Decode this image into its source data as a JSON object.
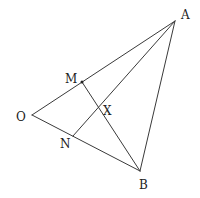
{
  "diagram": {
    "type": "geometry",
    "stroke_color": "#3a3a3a",
    "text_color": "#222222",
    "points": {
      "A": {
        "x": 175,
        "y": 21,
        "label": "A",
        "lx": 181,
        "ly": 19
      },
      "O": {
        "x": 32,
        "y": 115,
        "label": "O",
        "lx": 16,
        "ly": 121
      },
      "B": {
        "x": 140,
        "y": 171,
        "label": "B",
        "lx": 139,
        "ly": 189
      },
      "M": {
        "x": 82,
        "y": 82,
        "label": "M",
        "lx": 65,
        "ly": 83
      },
      "N": {
        "x": 73,
        "y": 136,
        "label": "N",
        "lx": 60,
        "ly": 148
      },
      "X": {
        "x": 97,
        "y": 108,
        "label": "X",
        "lx": 103,
        "ly": 115
      }
    },
    "segments": [
      {
        "from": "O",
        "to": "A"
      },
      {
        "from": "O",
        "to": "B"
      },
      {
        "from": "A",
        "to": "B"
      },
      {
        "from": "A",
        "to": "N"
      },
      {
        "from": "M",
        "to": "B"
      }
    ],
    "marked_points": [
      "M"
    ]
  }
}
